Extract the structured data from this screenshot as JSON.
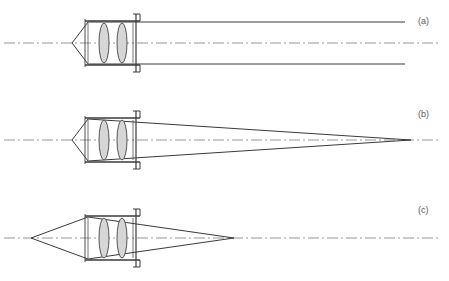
{
  "figure": {
    "width": 449,
    "height": 281,
    "background": "#ffffff"
  },
  "colors": {
    "ray_line": "#3a3a3a",
    "barrel_line": "#3a3a3a",
    "lens_outline": "#555555",
    "lens_fill": "#d6d6d6",
    "optical_axis": "#8a8a8a",
    "label_text": "#5a5a5a"
  },
  "panels": [
    {
      "id": "a",
      "label": "(a)",
      "label_x": 418,
      "label_y": 24,
      "axis_y": 43,
      "description": "Collimated output beam: rays exit parallel to the optical axis",
      "beam_mode": "collimated",
      "vertex_left": {
        "x": 72,
        "y": 43
      },
      "ray_top_y": 22,
      "ray_bottom_y": 64,
      "beam_right_x": 405,
      "axis_x_start": 4,
      "axis_x_end": 440,
      "assembly": {
        "barrel_left_x": 85,
        "barrel_right_x": 136,
        "barrel_top_y": 21,
        "barrel_bottom_y": 65,
        "flange_x": 136,
        "flange_top_y": 14,
        "flange_bottom_y": 72,
        "lens1_cx": 104,
        "lens2_cx": 122,
        "lens_rx": 5,
        "lens_ry": 20
      }
    },
    {
      "id": "b",
      "label": "(b)",
      "label_x": 418,
      "label_y": 117,
      "axis_y": 140,
      "description": "Slowly converging output beam focusing at a distant point",
      "beam_mode": "converging-far",
      "vertex_left": {
        "x": 72,
        "y": 140
      },
      "ray_top_y": 119,
      "ray_bottom_y": 161,
      "focus_right": {
        "x": 411,
        "y": 140
      },
      "axis_x_start": 4,
      "axis_x_end": 440,
      "assembly": {
        "barrel_left_x": 85,
        "barrel_right_x": 136,
        "barrel_top_y": 118,
        "barrel_bottom_y": 162,
        "flange_x": 136,
        "flange_top_y": 111,
        "flange_bottom_y": 169,
        "lens1_cx": 104,
        "lens2_cx": 122,
        "lens_rx": 5,
        "lens_ry": 20
      }
    },
    {
      "id": "c",
      "label": "(c)",
      "label_x": 418,
      "label_y": 213,
      "axis_y": 238,
      "description": "Strongly converging output beam focusing at a near point",
      "beam_mode": "converging-near",
      "vertex_left": {
        "x": 31,
        "y": 238
      },
      "ray_top_y": 217,
      "ray_bottom_y": 259,
      "focus_right": {
        "x": 234,
        "y": 238
      },
      "axis_x_start": 4,
      "axis_x_end": 440,
      "assembly": {
        "barrel_left_x": 85,
        "barrel_right_x": 136,
        "barrel_top_y": 216,
        "barrel_bottom_y": 260,
        "flange_x": 136,
        "flange_top_y": 209,
        "flange_bottom_y": 267,
        "lens1_cx": 104,
        "lens2_cx": 122,
        "lens_rx": 5,
        "lens_ry": 20
      }
    }
  ]
}
